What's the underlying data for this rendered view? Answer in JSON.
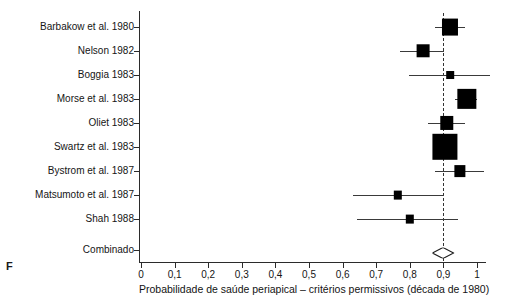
{
  "figure": {
    "panel_letter": "F",
    "axis_title": "Probabilidade de saúde periapical – critérios permissivos (década de 1980)",
    "summary_label": "Combinado"
  },
  "axis": {
    "tick_labels": [
      "0",
      "0,1",
      "0,2",
      "0,3",
      "0,4",
      "0,5",
      "0,6",
      "0,7",
      "0,8",
      "0,9",
      "1"
    ],
    "tick_values": [
      0,
      0.1,
      0.2,
      0.3,
      0.4,
      0.5,
      0.6,
      0.7,
      0.8,
      0.9,
      1
    ]
  },
  "colors": {
    "marker": "#000000",
    "axis": "#2b2b2b",
    "ci": "#3a3a3a",
    "reference_line": "#333333",
    "background": "#ffffff"
  },
  "chart_data": {
    "type": "scatter",
    "subtype": "forest-plot",
    "title": "",
    "xlabel": "Probabilidade de saúde periapical – critérios permissivos (década de 1980)",
    "ylabel": "",
    "xlim": [
      0,
      1
    ],
    "xticks": [
      0,
      0.1,
      0.2,
      0.3,
      0.4,
      0.5,
      0.6,
      0.7,
      0.8,
      0.9,
      1
    ],
    "xtick_labels": [
      "0",
      "0,1",
      "0,2",
      "0,3",
      "0,4",
      "0,5",
      "0,6",
      "0,7",
      "0,8",
      "0,9",
      "1"
    ],
    "grid": false,
    "legend": false,
    "reference_line": 0.9,
    "effect_measure": "Probabilidade de saúde periapical",
    "studies": [
      {
        "label": "Barbakow et al. 1980",
        "estimate": 0.92,
        "ci_low": 0.875,
        "ci_high": 0.965,
        "weight": 0.85
      },
      {
        "label": "Nelson 1982",
        "estimate": 0.84,
        "ci_low": 0.772,
        "ci_high": 0.902,
        "weight": 0.6
      },
      {
        "label": "Boggia 1983",
        "estimate": 0.92,
        "ci_low": 0.798,
        "ci_high": 1.04,
        "weight": 0.2
      },
      {
        "label": "Morse et al. 1983",
        "estimate": 0.97,
        "ci_low": 0.935,
        "ci_high": 1.0,
        "weight": 1.1
      },
      {
        "label": "Oliet 1983",
        "estimate": 0.91,
        "ci_low": 0.855,
        "ci_high": 0.965,
        "weight": 0.65
      },
      {
        "label": "Swartz et al. 1983",
        "estimate": 0.905,
        "ci_low": 0.875,
        "ci_high": 0.935,
        "weight": 1.55
      },
      {
        "label": "Bystrom et al. 1987",
        "estimate": 0.95,
        "ci_low": 0.875,
        "ci_high": 1.02,
        "weight": 0.48
      },
      {
        "label": "Matsumoto et al. 1987",
        "estimate": 0.765,
        "ci_low": 0.632,
        "ci_high": 0.902,
        "weight": 0.26
      },
      {
        "label": "Shah 1988",
        "estimate": 0.8,
        "ci_low": 0.643,
        "ci_high": 0.943,
        "weight": 0.26
      }
    ],
    "summary": {
      "label": "Combinado",
      "estimate": 0.9,
      "ci_low": 0.872,
      "ci_high": 0.935
    }
  }
}
